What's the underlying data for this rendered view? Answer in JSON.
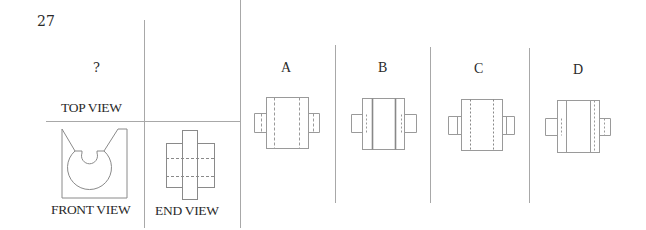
{
  "question": {
    "number": "27",
    "unknown_marker": "?"
  },
  "views": {
    "top_label": "TOP VIEW",
    "front_label": "FRONT VIEW",
    "end_label": "END VIEW"
  },
  "options": [
    {
      "label": "A"
    },
    {
      "label": "B"
    },
    {
      "label": "C"
    },
    {
      "label": "D"
    }
  ],
  "colors": {
    "line": "#9a9a9a",
    "text": "#2a2a2a",
    "background": "#ffffff"
  }
}
